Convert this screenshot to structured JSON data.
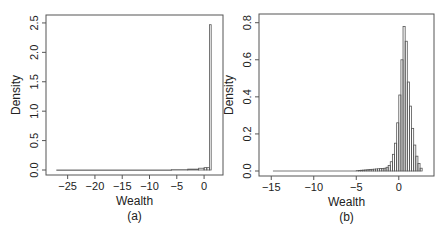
{
  "chart_data": [
    {
      "type": "bar",
      "panel_label": "(a)",
      "xlabel": "Wealth",
      "ylabel": "Density",
      "xlim": [
        -27.5,
        2
      ],
      "ylim": [
        0,
        2.55
      ],
      "xticks": [
        -25,
        -20,
        -15,
        -10,
        -5,
        0
      ],
      "xtick_labels": [
        "−25",
        "−20",
        "−15",
        "−10",
        "−5",
        "0"
      ],
      "yticks": [
        0.0,
        0.5,
        1.0,
        1.5,
        2.0,
        2.5
      ],
      "ytick_labels": [
        "0.0",
        "0.5",
        "1.0",
        "1.5",
        "2.0",
        "2.5"
      ],
      "bins": [
        {
          "x0": -27,
          "x1": -6,
          "y": 0.0
        },
        {
          "x0": -6,
          "x1": -3,
          "y": 0.005
        },
        {
          "x0": -3,
          "x1": -1,
          "y": 0.015
        },
        {
          "x0": -1,
          "x1": 0,
          "y": 0.03
        },
        {
          "x0": 0,
          "x1": 0.5,
          "y": 0.04
        },
        {
          "x0": 0.5,
          "x1": 1,
          "y": 0.04
        },
        {
          "x0": 1,
          "x1": 1.3,
          "y": 2.47
        }
      ],
      "grid": false
    },
    {
      "type": "bar",
      "panel_label": "(b)",
      "xlabel": "Wealth",
      "ylabel": "Density",
      "xlim": [
        -15.5,
        3.2
      ],
      "ylim": [
        0,
        0.82
      ],
      "xticks": [
        -15,
        -10,
        -5,
        0
      ],
      "xtick_labels": [
        "−15",
        "−10",
        "−5",
        "0"
      ],
      "yticks": [
        0.0,
        0.2,
        0.4,
        0.6,
        0.8
      ],
      "ytick_labels": [
        "0.0",
        "0.2",
        "0.4",
        "0.6",
        "0.8"
      ],
      "bin_width": 0.25,
      "bins_start": -5,
      "values": [
        0.002,
        0.003,
        0.004,
        0.005,
        0.006,
        0.007,
        0.008,
        0.009,
        0.01,
        0.011,
        0.012,
        0.013,
        0.014,
        0.015,
        0.02,
        0.03,
        0.05,
        0.09,
        0.15,
        0.26,
        0.41,
        0.6,
        0.78,
        0.7,
        0.48,
        0.35,
        0.23,
        0.14,
        0.08,
        0.04,
        0.015
      ],
      "tail": {
        "x0": -14.8,
        "x1": -5,
        "y": 0.001
      },
      "grid": false
    }
  ]
}
